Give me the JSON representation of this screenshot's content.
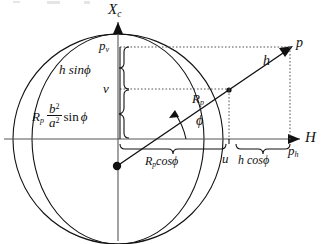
{
  "figure": {
    "type": "geometry-diagram",
    "axes": {
      "vertical": {
        "label": "X",
        "subscript": "c",
        "name": "vertical-axis-Xc"
      },
      "horizontal": {
        "label": "H",
        "subscript": "",
        "name": "horizontal-axis-H"
      }
    },
    "labels": {
      "point_p": "p",
      "point_pv": "p",
      "point_pv_sub": "v",
      "point_ph": "p",
      "point_ph_sub": "h",
      "h_vector": "h",
      "h_sin_phi": "h sin",
      "phi_glyph": "ϕ",
      "v_label": "v",
      "u_label": "u",
      "Rp_label": "R",
      "Rp_sub": "p",
      "Rp_b2a2_sinphi_lead": "R",
      "b_num": "b",
      "b_exp": "2",
      "a_den": "a",
      "a_exp": "2",
      "sin_word": "sin",
      "Rp_cos_phi": "R",
      "Rp_cos_phi_rest": "cos",
      "h_cos_phi": "h cos",
      "angle_phi": "ϕ"
    },
    "geometry": {
      "circle_center_x": 118,
      "circle_center_y": 139,
      "circle_radius": 105,
      "ellipse_semi_major": 105,
      "ellipse_semi_minor": 86,
      "origin_dot_x": 117,
      "origin_dot_y": 166,
      "point_p_x": 290,
      "point_p_y": 47,
      "point_u_x": 228,
      "point_v_y": 89,
      "point_pv_y": 47
    },
    "colors": {
      "stroke": "#111111",
      "background": "#ffffff",
      "dotted": "#555555"
    }
  }
}
